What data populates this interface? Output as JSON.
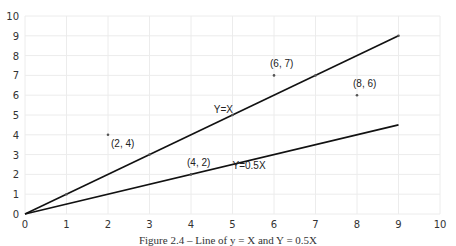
{
  "chart_data": {
    "type": "scatter",
    "title": "",
    "caption": "Figure 2.4 – Line of y = X and Y = 0.5X",
    "xlabel": "",
    "ylabel": "",
    "xlim": [
      0,
      10
    ],
    "ylim": [
      0,
      10
    ],
    "xticks": [
      0,
      1,
      2,
      3,
      4,
      5,
      6,
      7,
      8,
      9,
      10
    ],
    "yticks": [
      0,
      1,
      2,
      3,
      4,
      5,
      6,
      7,
      8,
      9,
      10
    ],
    "grid": true,
    "legend": null,
    "lines": [
      {
        "name": "Y=X",
        "x": [
          0,
          9
        ],
        "y": [
          0,
          9
        ],
        "label_pos": [
          4.55,
          5.1
        ]
      },
      {
        "name": "Y=0.5X",
        "x": [
          0,
          9
        ],
        "y": [
          0,
          4.5
        ],
        "label_pos": [
          5.0,
          2.25
        ]
      }
    ],
    "points": [
      {
        "x": 2,
        "y": 4,
        "label": "(2, 4)"
      },
      {
        "x": 4,
        "y": 2,
        "label": "(4, 2)"
      },
      {
        "x": 6,
        "y": 7,
        "label": "(6, 7)"
      },
      {
        "x": 8,
        "y": 6,
        "label": "(8, 6)"
      }
    ],
    "line_points": [
      {
        "x": 1,
        "y": 1
      },
      {
        "x": 3,
        "y": 3
      },
      {
        "x": 5,
        "y": 5
      },
      {
        "x": 7,
        "y": 7
      },
      {
        "x": 9,
        "y": 9
      }
    ]
  }
}
